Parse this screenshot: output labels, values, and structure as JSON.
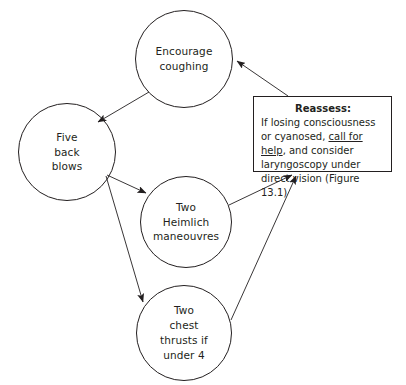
{
  "figure": {
    "background_color": "#ffffff",
    "line_color": "#231f20",
    "width": 406,
    "height": 385
  },
  "nodes": [
    {
      "id": "encourage-coughing",
      "label": "Encourage\ncoughing",
      "shape": "circle",
      "cx": 184,
      "cy": 59,
      "r": 49
    },
    {
      "id": "five-back-blows",
      "label": "Five\nback\nblows",
      "shape": "circle",
      "cx": 67,
      "cy": 152,
      "r": 49
    },
    {
      "id": "two-heimlich-maneouvres",
      "label": "Two\nHeimlich\nmaneouvres",
      "shape": "circle",
      "cx": 186,
      "cy": 222,
      "r": 46
    },
    {
      "id": "two-chest-thrusts",
      "label": "Two\nchest\nthrusts if\nunder 4",
      "shape": "circle",
      "cx": 184,
      "cy": 333,
      "r": 48
    }
  ],
  "reassess_box": {
    "title": "Reassess:",
    "line1": "If losing consciousness or",
    "line2_a": "cyanosed, ",
    "line2_link": "call for help",
    "line2_b": ", and",
    "line3": "consider laryngoscopy under",
    "line4": "direct vision (Figure 13.1)"
  },
  "edges": [
    {
      "id": "encourage-to-backblows",
      "from": "encourage-coughing",
      "to": "five-back-blows"
    },
    {
      "id": "backblows-to-heimlich",
      "from": "five-back-blows",
      "to": "two-heimlich-maneouvres"
    },
    {
      "id": "backblows-to-chestthrusts",
      "from": "five-back-blows",
      "to": "two-chest-thrusts"
    },
    {
      "id": "heimlich-to-reassess",
      "from": "two-heimlich-maneouvres",
      "to": "reassess-box"
    },
    {
      "id": "chestthrusts-to-reassess",
      "from": "two-chest-thrusts",
      "to": "reassess-box"
    },
    {
      "id": "reassess-to-encourage",
      "from": "reassess-box",
      "to": "encourage-coughing"
    }
  ]
}
